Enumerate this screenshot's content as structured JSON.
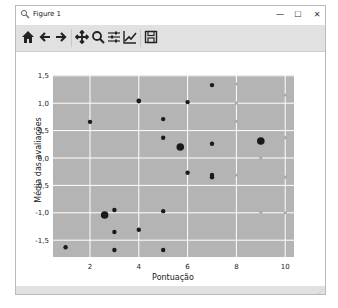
{
  "window": {
    "title": "Figure 1",
    "controls": {
      "minimize": "—",
      "maximize": "☐",
      "close": "✕"
    }
  },
  "toolbar": {
    "buttons": [
      {
        "name": "home-icon",
        "glyph": "⌂",
        "label": "Home"
      },
      {
        "name": "back-icon",
        "glyph": "←",
        "label": "Back"
      },
      {
        "name": "forward-icon",
        "glyph": "→",
        "label": "Forward"
      },
      {
        "name": "pan-icon",
        "glyph": "✥",
        "label": "Pan"
      },
      {
        "name": "zoom-icon",
        "glyph": "🔍",
        "label": "Zoom"
      },
      {
        "name": "configure-subplots-icon",
        "glyph": "☰",
        "label": "Configure subplots"
      },
      {
        "name": "edit-axis-icon",
        "glyph": "📈",
        "label": "Edit axis"
      },
      {
        "name": "save-icon",
        "glyph": "💾",
        "label": "Save"
      }
    ]
  },
  "colors": {
    "plot_bg": "#b4b4b4",
    "grid": "#ffffff",
    "point": "#1a1a1a",
    "faint_point": "#a9a9a9"
  },
  "chart_data": {
    "type": "scatter",
    "title": "",
    "xlabel": "Pontuação",
    "ylabel": "Média das avaliações",
    "xlim": [
      0.5,
      10.5
    ],
    "ylim": [
      -1.85,
      1.5
    ],
    "xticks": [
      2,
      4,
      6,
      8,
      10
    ],
    "xtick_labels": [
      "2",
      "4",
      "6",
      "8",
      "10"
    ],
    "yticks": [
      1.5,
      1.0,
      0.5,
      0.0,
      -0.5,
      -1.0,
      -1.5
    ],
    "ytick_labels": [
      "1,5",
      "1,0",
      "0,5",
      "0,0",
      "-0,5",
      "-1,0",
      "-1,5"
    ],
    "grid": true,
    "legend": null,
    "series": [
      {
        "name": "dark points",
        "points": [
          {
            "x": 1.0,
            "y": -1.63,
            "size": 2.2
          },
          {
            "x": 2.0,
            "y": 0.66,
            "size": 2.2
          },
          {
            "x": 2.6,
            "y": -1.04,
            "size": 3.8
          },
          {
            "x": 3.0,
            "y": -0.95,
            "size": 2.2
          },
          {
            "x": 3.0,
            "y": -1.35,
            "size": 2.2
          },
          {
            "x": 3.0,
            "y": -1.68,
            "size": 2.2
          },
          {
            "x": 4.0,
            "y": 1.04,
            "size": 2.4
          },
          {
            "x": 4.0,
            "y": -1.31,
            "size": 2.2
          },
          {
            "x": 5.0,
            "y": 0.71,
            "size": 2.2
          },
          {
            "x": 5.0,
            "y": 0.37,
            "size": 2.2
          },
          {
            "x": 5.0,
            "y": -0.97,
            "size": 2.2
          },
          {
            "x": 5.0,
            "y": -1.68,
            "size": 2.2
          },
          {
            "x": 5.7,
            "y": 0.2,
            "size": 3.8
          },
          {
            "x": 6.0,
            "y": 1.02,
            "size": 2.2
          },
          {
            "x": 6.0,
            "y": -0.27,
            "size": 2.2
          },
          {
            "x": 7.0,
            "y": 1.33,
            "size": 2.2
          },
          {
            "x": 7.0,
            "y": 0.26,
            "size": 2.2
          },
          {
            "x": 7.0,
            "y": -0.31,
            "size": 2.2
          },
          {
            "x": 7.0,
            "y": -0.35,
            "size": 2.2
          },
          {
            "x": 9.0,
            "y": 0.31,
            "size": 3.8
          }
        ]
      },
      {
        "name": "faint points",
        "points": [
          {
            "x": 8.0,
            "y": 1.35,
            "size": 1.6
          },
          {
            "x": 8.0,
            "y": 1.0,
            "size": 1.6
          },
          {
            "x": 8.0,
            "y": 0.67,
            "size": 1.6
          },
          {
            "x": 8.0,
            "y": -0.31,
            "size": 1.6
          },
          {
            "x": 9.0,
            "y": 0.0,
            "size": 1.6
          },
          {
            "x": 9.0,
            "y": -0.99,
            "size": 1.6
          },
          {
            "x": 10.0,
            "y": 1.15,
            "size": 1.6
          },
          {
            "x": 10.0,
            "y": 0.37,
            "size": 1.6
          },
          {
            "x": 10.0,
            "y": -0.35,
            "size": 1.6
          },
          {
            "x": 10.0,
            "y": -1.0,
            "size": 1.6
          }
        ]
      }
    ]
  }
}
